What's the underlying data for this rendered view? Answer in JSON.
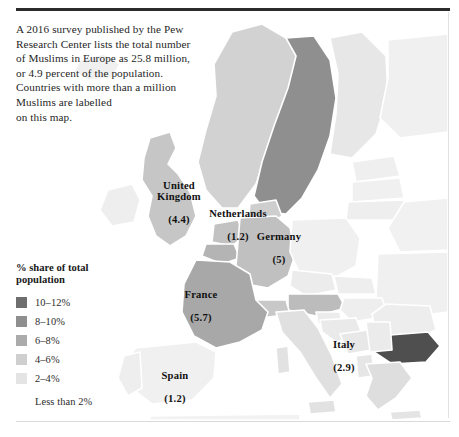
{
  "intro": {
    "text": "A 2016 survey published by the Pew\nResearch Center lists the total number\nof Muslims in Europe as 25.8 million,\nor 4.9 percent of the population.\nCountries with more than a million\nMuslims are labelled\non this map."
  },
  "legend": {
    "title": "% share of total\npopulation",
    "items": [
      {
        "label": "10–12%",
        "color": "#6e6e6e",
        "has_swatch": true
      },
      {
        "label": "8–10%",
        "color": "#8f8f8f",
        "has_swatch": true
      },
      {
        "label": "6–8%",
        "color": "#ababab",
        "has_swatch": true
      },
      {
        "label": "4–6%",
        "color": "#cfcfcf",
        "has_swatch": true
      },
      {
        "label": "2–4%",
        "color": "#e4e4e4",
        "has_swatch": true
      },
      {
        "label": "Less than 2%",
        "color": "#f2f2f2",
        "has_swatch": false
      }
    ]
  },
  "map": {
    "labels": [
      {
        "name": "united-kingdom",
        "country": "United\nKingdom",
        "value": "(4.4)",
        "x": 142,
        "y": 168,
        "w": 74
      },
      {
        "name": "netherlands",
        "country": "Netherlands",
        "value": "(1.2)",
        "x": 197,
        "y": 196,
        "w": 82
      },
      {
        "name": "germany",
        "country": "Germany",
        "value": "(5)",
        "x": 248,
        "y": 219,
        "w": 62
      },
      {
        "name": "france",
        "country": "France",
        "value": "(5.7)",
        "x": 170,
        "y": 277,
        "w": 62
      },
      {
        "name": "italy",
        "country": "Italy",
        "value": "(2.9)",
        "x": 320,
        "y": 327,
        "w": 48
      },
      {
        "name": "spain",
        "country": "Spain",
        "value": "(1.2)",
        "x": 148,
        "y": 358,
        "w": 54
      }
    ],
    "colors": {
      "sea": "#ffffff",
      "very_light": "#f0f0f0",
      "light": "#e4e4e4",
      "mid_light": "#d2d2d2",
      "mid": "#bdbdbd",
      "mid_dark": "#ababab",
      "dark": "#8f8f8f",
      "darkest": "#4f4f4f",
      "border": "#ffffff"
    },
    "shaded_countries": [
      {
        "name": "bulgaria",
        "band": "10–12%"
      },
      {
        "name": "sweden",
        "band": "8–10%"
      },
      {
        "name": "france",
        "band": "6–8%"
      },
      {
        "name": "germany",
        "band": "4–6%"
      },
      {
        "name": "united-kingdom",
        "band": "4–6%"
      },
      {
        "name": "netherlands",
        "band": "4–6%"
      },
      {
        "name": "austria",
        "band": "6–8%"
      },
      {
        "name": "switzerland",
        "band": "4–6%"
      },
      {
        "name": "norway",
        "band": "2–4%"
      },
      {
        "name": "denmark",
        "band": "4–6%"
      },
      {
        "name": "belgium",
        "band": "6–8%"
      },
      {
        "name": "greece",
        "band": "4–6%"
      },
      {
        "name": "italy",
        "band": "2–4%"
      },
      {
        "name": "spain",
        "band": "Less than 2%"
      },
      {
        "name": "finland",
        "band": "Less than 2%"
      },
      {
        "name": "poland",
        "band": "Less than 2%"
      }
    ]
  }
}
